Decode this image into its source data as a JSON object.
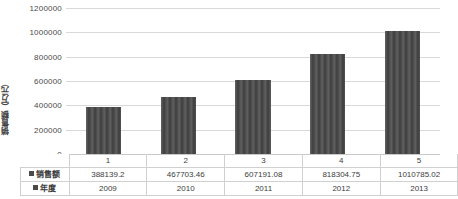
{
  "chart_data": {
    "type": "bar",
    "title": "",
    "subtitle": "",
    "xlabel": "",
    "ylabel": "销售额（万元）",
    "categories": [
      "1",
      "2",
      "3",
      "4",
      "5"
    ],
    "series": [
      {
        "name": "销售额",
        "values": [
          388139.2,
          467703.46,
          607191.08,
          818304.75,
          1010785.02
        ],
        "display_values": [
          "388139.2",
          "467703.46",
          "607191.08",
          "818304.75",
          "1010785.02"
        ]
      },
      {
        "name": "年度",
        "values": [
          2009,
          2010,
          2011,
          2012,
          2013
        ],
        "display_values": [
          "2009",
          "2010",
          "2011",
          "2012",
          "2013"
        ]
      }
    ],
    "ylim": [
      0,
      1200000
    ],
    "ytick_values": [
      0,
      200000,
      400000,
      600000,
      800000,
      1000000,
      1200000
    ],
    "ytick_labels": [
      "0",
      "200000",
      "400000",
      "600000",
      "800000",
      "1000000",
      "1200000"
    ],
    "grid": true,
    "legend_position": "data-table",
    "bar_color": "#4b4b4b",
    "gridline_color": "#d9d9d9",
    "axis_color": "#9a9a9a",
    "background_color": "#ffffff"
  },
  "y_axis": {
    "title": "销售额（万元）",
    "ticks": [
      "1200000",
      "1000000",
      "800000",
      "600000",
      "400000",
      "200000",
      "0"
    ]
  },
  "data_table": {
    "category_row": [
      "1",
      "2",
      "3",
      "4",
      "5"
    ],
    "rows": [
      {
        "label": "销售额",
        "cells": [
          "388139.2",
          "467703.46",
          "607191.08",
          "818304.75",
          "1010785.02"
        ]
      },
      {
        "label": "年度",
        "cells": [
          "2009",
          "2010",
          "2011",
          "2012",
          "2013"
        ]
      }
    ]
  }
}
